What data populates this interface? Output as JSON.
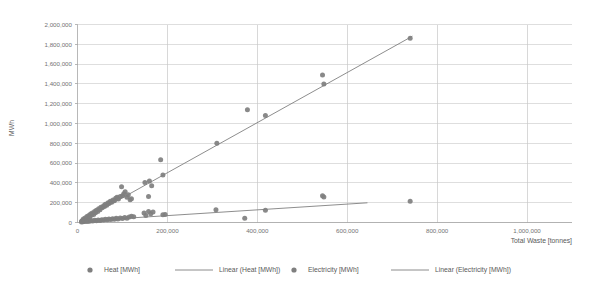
{
  "chart_data": {
    "type": "scatter",
    "title": "",
    "xlabel": "Total Waste [tonnes]",
    "ylabel": "MWh",
    "xlim": [
      0,
      1100000
    ],
    "ylim": [
      0,
      2000000
    ],
    "grid": true,
    "legend_position": "bottom",
    "xticks": [
      0,
      200000,
      400000,
      600000,
      800000,
      1000000
    ],
    "xtick_labels": [
      "0",
      "200,000",
      "400,000",
      "600,000",
      "800,000",
      "1,000,000"
    ],
    "yticks": [
      0,
      200000,
      400000,
      600000,
      800000,
      1000000,
      1200000,
      1400000,
      1600000,
      1800000,
      2000000
    ],
    "ytick_labels": [
      "0",
      "200,000",
      "400,000",
      "600,000",
      "800,000",
      "1,000,000",
      "1,200,000",
      "1,400,000",
      "1,600,000",
      "1,800,000",
      "2,000,000"
    ],
    "series": [
      {
        "name": "Heat [MWh]",
        "type": "scatter",
        "marker_color": "#7f7f7f",
        "points": [
          [
            9000,
            12000
          ],
          [
            11000,
            20000
          ],
          [
            13000,
            35000
          ],
          [
            15000,
            18000
          ],
          [
            17000,
            45000
          ],
          [
            19000,
            30000
          ],
          [
            21000,
            60000
          ],
          [
            23000,
            48000
          ],
          [
            25000,
            70000
          ],
          [
            27000,
            55000
          ],
          [
            29000,
            85000
          ],
          [
            31000,
            72000
          ],
          [
            33000,
            95000
          ],
          [
            36000,
            80000
          ],
          [
            38000,
            110000
          ],
          [
            40000,
            98000
          ],
          [
            42000,
            125000
          ],
          [
            45000,
            112000
          ],
          [
            47000,
            140000
          ],
          [
            50000,
            130000
          ],
          [
            52000,
            155000
          ],
          [
            55000,
            148000
          ],
          [
            58000,
            170000
          ],
          [
            60000,
            162000
          ],
          [
            62000,
            185000
          ],
          [
            65000,
            175000
          ],
          [
            68000,
            200000
          ],
          [
            70000,
            192000
          ],
          [
            73000,
            215000
          ],
          [
            76000,
            205000
          ],
          [
            79000,
            228000
          ],
          [
            82000,
            220000
          ],
          [
            85000,
            245000
          ],
          [
            88000,
            255000
          ],
          [
            91000,
            238000
          ],
          [
            95000,
            262000
          ],
          [
            98000,
            360000
          ],
          [
            100000,
            270000
          ],
          [
            103000,
            290000
          ],
          [
            106000,
            310000
          ],
          [
            110000,
            255000
          ],
          [
            113000,
            280000
          ],
          [
            117000,
            230000
          ],
          [
            120000,
            240000
          ],
          [
            150000,
            405000
          ],
          [
            158000,
            262000
          ],
          [
            160000,
            418000
          ],
          [
            165000,
            372000
          ],
          [
            185000,
            635000
          ],
          [
            190000,
            480000
          ],
          [
            195000,
            80000
          ],
          [
            310000,
            800000
          ],
          [
            378000,
            1140000
          ],
          [
            418000,
            1080000
          ],
          [
            545000,
            1490000
          ],
          [
            548000,
            1400000
          ],
          [
            740000,
            1860000
          ]
        ]
      },
      {
        "name": "Linear (Heat [MWh])",
        "type": "trendline",
        "line_color": "#808080",
        "slope": 2.53,
        "intercept": -3000,
        "x_start": 9000,
        "x_end": 745000,
        "y_start": 19000,
        "y_end": 1882000
      },
      {
        "name": "Electricity [MWh]",
        "type": "scatter",
        "marker_color": "#7f7f7f",
        "points": [
          [
            9000,
            5000
          ],
          [
            12000,
            8000
          ],
          [
            15000,
            10000
          ],
          [
            18000,
            14000
          ],
          [
            21000,
            9000
          ],
          [
            24000,
            16000
          ],
          [
            27000,
            12000
          ],
          [
            30000,
            20000
          ],
          [
            34000,
            15000
          ],
          [
            38000,
            22000
          ],
          [
            42000,
            18000
          ],
          [
            46000,
            25000
          ],
          [
            50000,
            20000
          ],
          [
            54000,
            28000
          ],
          [
            58000,
            24000
          ],
          [
            62000,
            32000
          ],
          [
            66000,
            27000
          ],
          [
            70000,
            35000
          ],
          [
            74000,
            30000
          ],
          [
            78000,
            38000
          ],
          [
            82000,
            33000
          ],
          [
            86000,
            42000
          ],
          [
            90000,
            36000
          ],
          [
            95000,
            45000
          ],
          [
            100000,
            40000
          ],
          [
            105000,
            50000
          ],
          [
            110000,
            44000
          ],
          [
            115000,
            55000
          ],
          [
            120000,
            62000
          ],
          [
            125000,
            58000
          ],
          [
            148000,
            95000
          ],
          [
            152000,
            70000
          ],
          [
            158000,
            112000
          ],
          [
            163000,
            88000
          ],
          [
            168000,
            105000
          ],
          [
            190000,
            78000
          ],
          [
            308000,
            128000
          ],
          [
            372000,
            42000
          ],
          [
            418000,
            125000
          ],
          [
            545000,
            270000
          ],
          [
            548000,
            258000
          ],
          [
            740000,
            215000
          ]
        ]
      },
      {
        "name": "Linear (Electricity [MWh])",
        "type": "trendline",
        "line_color": "#808080",
        "slope": 0.29,
        "intercept": 12000,
        "x_start": 9000,
        "x_end": 645000,
        "y_start": 14000,
        "y_end": 199000
      }
    ]
  },
  "legend": {
    "items": [
      {
        "label": "Heat [MWh]",
        "kind": "marker"
      },
      {
        "label": "Linear (Heat [MWh])",
        "kind": "line"
      },
      {
        "label": "Electricity [MWh]",
        "kind": "marker"
      },
      {
        "label": "Linear (Electricity [MWh])",
        "kind": "line"
      }
    ]
  },
  "colors": {
    "marker": "#7f7f7f",
    "line": "#808080",
    "grid": "#d0d0d0",
    "axis": "#a6a6a6",
    "text": "#595959",
    "background": "#ffffff"
  }
}
